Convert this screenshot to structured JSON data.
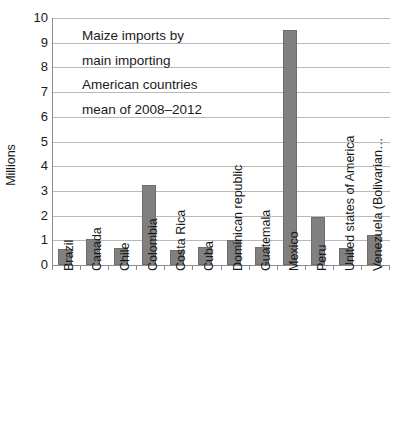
{
  "chart_data": {
    "type": "bar",
    "title_lines": [
      "Maize imports by",
      "main importing",
      "American countries",
      "mean of 2008–2012"
    ],
    "xlabel": "",
    "ylabel": "Millions",
    "ylim": [
      0,
      10
    ],
    "ytick_values": [
      0,
      1,
      2,
      3,
      4,
      5,
      6,
      7,
      8,
      9,
      10
    ],
    "ytick_labels": [
      "0",
      "1",
      "2",
      "3",
      "4",
      "5",
      "6",
      "7",
      "8",
      "9",
      "10"
    ],
    "grid": true,
    "legend": false,
    "bar_color": "#808080",
    "gridline_color": "#b9b9b9",
    "axis_color": "#8c8c8c",
    "categories": [
      "Brazil",
      "Canada",
      "Chile",
      "Colombia",
      "Costa Rica",
      "Cuba",
      "Dominican republic",
      "Guatemala",
      "Mexico",
      "Peru",
      "United states of America",
      "Venezuela (Bolivarian…"
    ],
    "values": [
      0.65,
      1.05,
      0.67,
      3.23,
      0.6,
      0.73,
      1.02,
      0.73,
      9.52,
      1.95,
      0.67,
      1.22
    ],
    "units": "Millions"
  }
}
